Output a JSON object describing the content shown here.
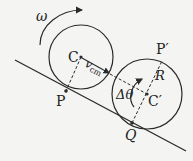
{
  "diagram": {
    "labels": {
      "omega": "ω",
      "c": "C",
      "vcm_v": "v",
      "vcm_sub": "cm",
      "p": "P",
      "p_prime": "P′",
      "r": "R",
      "delta_theta": "Δθ",
      "c_prime": "C′",
      "q": "Q"
    },
    "colors": {
      "stroke": "#2a2a2a",
      "background": "#f4f4f2"
    }
  }
}
